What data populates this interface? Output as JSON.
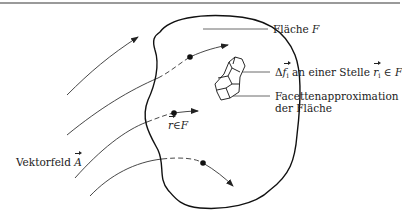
{
  "labels": {
    "surface": {
      "text": "Fläche",
      "symbol": "F"
    },
    "element": {
      "delta": "Δ",
      "f": "f",
      "f_sub": "i",
      "text": " an einer Stelle ",
      "r": "r",
      "r_sub": "i",
      "in": " ∈ ",
      "F": "F"
    },
    "facet_line1": "Facettenapproximation",
    "facet_line2": "der Fläche",
    "point": {
      "r": "r",
      "in": "∈",
      "F": "F"
    },
    "field": {
      "text": "Vektorfeld ",
      "A": "A"
    }
  },
  "colors": {
    "stroke": "#222222",
    "topline": "#9a9a9a"
  }
}
